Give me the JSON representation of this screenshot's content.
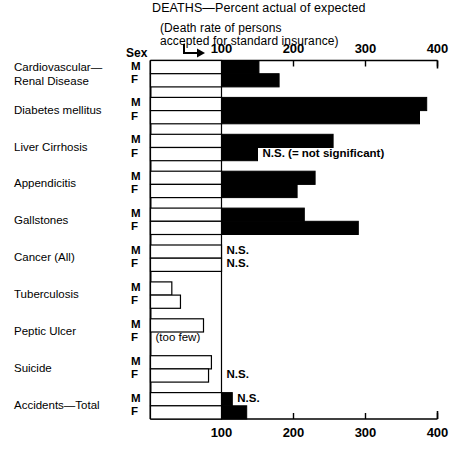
{
  "title": "DEATHS—Percent actual of expected",
  "subtitle_line1": "(Death rate of persons",
  "subtitle_line2": "accepted for standard insurance)",
  "sex_header": "Sex",
  "sex_male": "M",
  "sex_female": "F",
  "arrow_icon": "hook-arrow-right-icon",
  "ns_legend": "N.S. (= not significant)",
  "ns_short": "N.S.",
  "too_few": "(too few)",
  "axis": {
    "ticks": [
      "100",
      "200",
      "300",
      "400"
    ],
    "tick_values": [
      100,
      200,
      300,
      400
    ],
    "min": 0,
    "max": 400,
    "reference_line": 100
  },
  "chart_data": {
    "type": "bar",
    "orientation": "horizontal",
    "title": "DEATHS—Percent actual of expected",
    "subtitle": "(Death rate of persons accepted for standard insurance)",
    "xlabel": "Percent actual of expected",
    "ylabel": "",
    "xlim": [
      0,
      400
    ],
    "xticks": [
      100,
      200,
      300,
      400
    ],
    "reference_line": 100,
    "grid": false,
    "legend": "none",
    "categories": [
      "Cardiovascular—Renal Disease",
      "Diabetes mellitus",
      "Liver Cirrhosis",
      "Appendicitis",
      "Gallstones",
      "Cancer (All)",
      "Tuberculosis",
      "Peptic Ulcer",
      "Suicide",
      "Accidents—Total"
    ],
    "series": [
      {
        "name": "M",
        "values": [
          152,
          385,
          255,
          230,
          215,
          100,
          31,
          75,
          86,
          115
        ]
      },
      {
        "name": "F",
        "values": [
          180,
          375,
          150,
          205,
          290,
          100,
          43,
          null,
          82,
          135
        ]
      }
    ],
    "annotations": [
      {
        "category": "Liver Cirrhosis",
        "sex": "F",
        "text": "N.S. (= not significant)"
      },
      {
        "category": "Cancer (All)",
        "sex": "M",
        "text": "N.S."
      },
      {
        "category": "Cancer (All)",
        "sex": "F",
        "text": "N.S."
      },
      {
        "category": "Peptic Ulcer",
        "sex": "F",
        "text": "(too few)"
      },
      {
        "category": "Suicide",
        "sex": "F",
        "text": "N.S."
      },
      {
        "category": "Accidents—Total",
        "sex": "M",
        "text": "N.S."
      }
    ]
  },
  "rows": [
    {
      "label_line1": "Cardiovascular—",
      "label_line2": "Renal Disease",
      "m": 152,
      "f": 180,
      "m_note": "",
      "f_note": ""
    },
    {
      "label_line1": "Diabetes mellitus",
      "label_line2": "",
      "m": 385,
      "f": 375,
      "m_note": "",
      "f_note": ""
    },
    {
      "label_line1": "Liver Cirrhosis",
      "label_line2": "",
      "m": 255,
      "f": 150,
      "m_note": "",
      "f_note": "N.S. (= not significant)"
    },
    {
      "label_line1": "Appendicitis",
      "label_line2": "",
      "m": 230,
      "f": 205,
      "m_note": "",
      "f_note": ""
    },
    {
      "label_line1": "Gallstones",
      "label_line2": "",
      "m": 215,
      "f": 290,
      "m_note": "",
      "f_note": ""
    },
    {
      "label_line1": "Cancer (All)",
      "label_line2": "",
      "m": 100,
      "f": 100,
      "m_note": "N.S.",
      "f_note": "N.S."
    },
    {
      "label_line1": "Tuberculosis",
      "label_line2": "",
      "m": 31,
      "f": 43,
      "m_note": "",
      "f_note": ""
    },
    {
      "label_line1": "Peptic Ulcer",
      "label_line2": "",
      "m": 75,
      "f": null,
      "m_note": "",
      "f_note": "(too few)"
    },
    {
      "label_line1": "Suicide",
      "label_line2": "",
      "m": 86,
      "f": 82,
      "m_note": "",
      "f_note": "N.S."
    },
    {
      "label_line1": "Accidents—Total",
      "label_line2": "",
      "m": 115,
      "f": 135,
      "m_note": "N.S.",
      "f_note": ""
    }
  ],
  "colors": {
    "bar_fill": "#000000",
    "bar_outline": "#000000",
    "background": "#ffffff",
    "text": "#000000"
  }
}
